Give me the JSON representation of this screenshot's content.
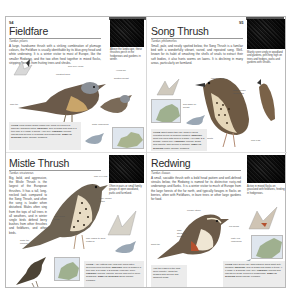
{
  "spread": {
    "running_head_left": "THRUSHES",
    "running_head_right": "THRUSHES"
  },
  "entries": [
    {
      "id": "fieldfare",
      "page_number": "94",
      "title": "Fieldfare",
      "latin": "Turdus pilaris",
      "intro": "A large, handsome thrush with a striking combination of plumage colours, the Fieldfare is usually identifiable by its blue-grey head and white underwing. It is a winter visitor to most of Europe, like the smaller Redwing, and the two often feed together in mixed flocks, stripping berries from fruiting trees and shrubs.",
      "photo_caption": "Above the landscape, these thrushes perch in the hedgerows and gardens in winter.",
      "annotations": [
        "blue-grey head",
        "chestnut back",
        "dark tail",
        "yellow bill",
        "spotted breast",
        "white underwing"
      ],
      "infobox": {
        "voice_label": "VOICE",
        "voice": "Loud chack-chack-chack call; song is a series of squeaky warbling notes.",
        "nesting_label": "NESTING",
        "nesting": "Cup of grass and mud in a tree fork; 5-6 eggs; 1 brood; April-July.",
        "feeding_label": "FEEDING",
        "feeding": "Worms, insects and berries in orchards and hedgerows.",
        "similar_label": "SIMILAR SPECIES",
        "similar": "Mistle Thrush; Redwing"
      }
    },
    {
      "id": "song-thrush",
      "page_number": "95",
      "title": "Song Thrush",
      "latin": "Turdus philomelos",
      "intro": "Small, pale, and neatly spotted below, the Song Thrush is a familiar bird with a wonderfully vibrant, varied, and repeated song. Well-known for its habit of smashing the shells of snails to extract their soft bodies, it also hunts worms on lawns. It is declining in many areas, particularly on farmland.",
      "photo_caption": "Mainly seen singly in woodland and gardens, perching high on trees and hedges, parks and gardens with shrubs.",
      "annotations": [
        "pale eye-ring",
        "warm brown upperparts",
        "buff wash on breast",
        "V-shaped spots",
        "pink legs"
      ],
      "infobox": {
        "voice_label": "VOICE",
        "voice": "Short sharp tsip call; song a varied repeated series of musical phrases.",
        "nesting_label": "NESTING",
        "nesting": "Neat cup lined with mud in a bush; 4-5 eggs; 2-3 broods; March-July.",
        "feeding_label": "FEEDING",
        "feeding": "Worms, snails and insects; also berries in autumn.",
        "similar_label": "SIMILAR SPECIES",
        "similar": "Mistle Thrush; Redwing"
      }
    },
    {
      "id": "mistle-thrush",
      "title": "Mistle Thrush",
      "latin": "Turdus viscivorus",
      "intro": "Big, bold, and aggressive, the Mistle Thrush is the largest of the European thrushes. It has a tall, long-necked look compared to the Song Thrush, and often the song is louder when disturbed. Males often sing from the tops of tall trees in all weathers, and in winter single birds defend berry bushes from other thrushes and fieldfares, and other birds.",
      "photo_caption": "Often in pairs or small family groups in open woodland, parks and farmland.",
      "annotations": [
        "pale eye-ring",
        "grey-brown back",
        "white tail corners",
        "bold round spots",
        "pale edges to wing feathers"
      ],
      "infobox": {
        "voice_label": "VOICE",
        "voice": "A dry rattling call; loud fluty song often delivered from treetops.",
        "nesting_label": "NESTING",
        "nesting": "Cup of grass in a tree fork; 3-5 eggs; 1-2 broods; February-June.",
        "feeding_label": "FEEDING",
        "feeding": "Worms, insects, berries and fruit in open grassland.",
        "similar_label": "SIMILAR SPECIES",
        "similar": "Song Thrush; Fieldfare"
      }
    },
    {
      "id": "redwing",
      "title": "Redwing",
      "latin": "Turdus iliacus",
      "intro": "A small, sociable thrush with a bold head pattern and well-defined streaks below, the Redwing is named for its distinctive rusty-red underwings and flanks. It is a winter visitor to much of Europe from the large forests of the far north, and typically forages in flocks on berries, often with Fieldfares, in bare trees or other large gardens for food.",
      "photo_caption": "Active in mixed flocks on grassland with fieldfares, feeding in hedgerows.",
      "annotations": [
        "creamy stripe",
        "dark-streaked breast",
        "red flanks",
        "rusty-red underwing",
        "short tail"
      ],
      "side_note": "Visit the edges of the wild, open country, using tall hedges with berries and adjacent fields.",
      "infobox": {
        "voice_label": "VOICE",
        "voice": "Thin seeep call, high-pitched; song short fluty phrases.",
        "nesting_label": "NESTING",
        "nesting": "Cup of grass and moss in trees; 4-6 eggs; 1-2 broods; May-July.",
        "feeding_label": "FEEDING",
        "feeding": "Worms and insects on fields, berries in hedgerows.",
        "similar_label": "SIMILAR SPECIES",
        "similar": "Song Thrush; Fieldfare"
      }
    }
  ],
  "colors": {
    "page_bg": "#ffffff",
    "border": "#b8b8b8",
    "infobox_bg": "#ececec",
    "text": "#333333",
    "map_sea": "#dfe6ee"
  }
}
